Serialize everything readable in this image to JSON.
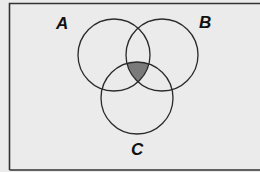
{
  "diagram": {
    "type": "venn",
    "sets": [
      {
        "id": "A",
        "label": "A",
        "cx": 114,
        "cy": 55,
        "r": 36,
        "label_x": 56,
        "label_y": 17
      },
      {
        "id": "B",
        "label": "B",
        "cx": 162,
        "cy": 55,
        "r": 36,
        "label_x": 199,
        "label_y": 16
      },
      {
        "id": "C",
        "label": "C",
        "cx": 137,
        "cy": 98,
        "r": 36,
        "label_x": 131,
        "label_y": 143
      }
    ],
    "shaded_region": "A ∩ B ∩ C",
    "colors": {
      "background": "#ebebeb",
      "frame": "#333333",
      "circle_stroke": "#2a2a2a",
      "shade": "#7a7a7a"
    }
  }
}
